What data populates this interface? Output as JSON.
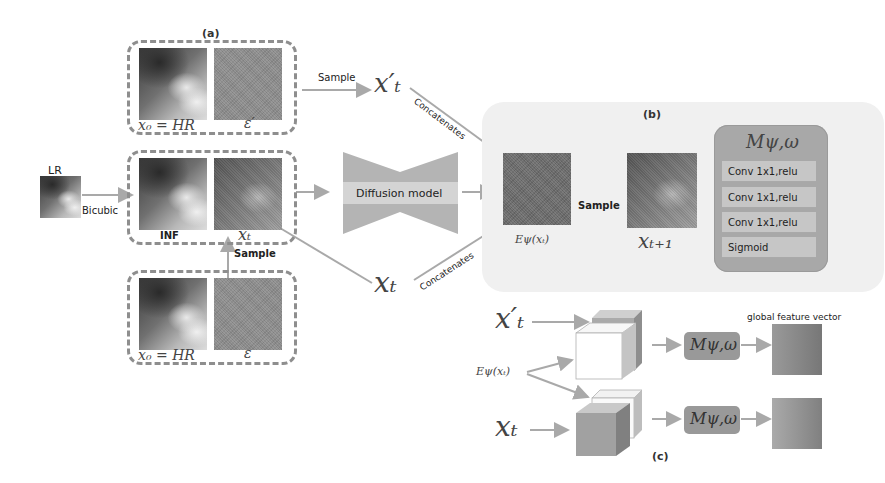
{
  "panels": {
    "a": {
      "label": "(a)"
    },
    "b": {
      "label": "(b)"
    },
    "c": {
      "label": "(c)"
    }
  },
  "inputs": {
    "lr_label": "LR",
    "bicubic_label": "Bicubic",
    "inf_label": "INF"
  },
  "boxes": {
    "top_hr_label": "x₀ = HR",
    "top_noise_label": "ε′",
    "mid_xt_label": "xₜ",
    "bottom_hr_label": "x₀ = HR",
    "bottom_noise_label": "ε"
  },
  "arrows": {
    "sample_top": "Sample",
    "sample_mid": "Sample",
    "sample_b": "Sample",
    "concat_top": "Concatenates",
    "concat_bottom": "Concatenates"
  },
  "symbols": {
    "x_t_prime": "x′ₜ",
    "x_t": "xₜ",
    "e_psi": "Eψ(xₜ)",
    "x_t_plus_1": "xₜ₊₁",
    "m_psi_omega": "Mψ,ω"
  },
  "diffusion_model": {
    "label": "Diffusion model"
  },
  "m_block": {
    "title": "Mψ,ω",
    "layers": [
      "Conv 1x1,relu",
      "Conv 1x1,relu",
      "Conv 1x1,relu",
      "Sigmoid"
    ]
  },
  "panel_c": {
    "x_t_prime": "x′ₜ",
    "e_psi": "Eψ(xₜ)",
    "x_t": "xₜ",
    "m_top": "Mψ,ω",
    "m_bottom": "Mψ,ω",
    "global_feature_label": "global feature vector"
  }
}
